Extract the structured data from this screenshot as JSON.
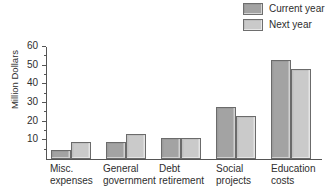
{
  "chart_data": {
    "type": "bar",
    "title": "",
    "xlabel": "",
    "ylabel": "Million Dollars",
    "ylim": [
      0,
      60
    ],
    "ytick_labels": [
      "10",
      "20",
      "30",
      "40",
      "50",
      "60"
    ],
    "ytick_values": [
      10,
      20,
      30,
      40,
      50,
      60
    ],
    "minor_tick_values": [
      5,
      15,
      25,
      35,
      45,
      55
    ],
    "grid": false,
    "legend_position": "top-right",
    "categories": [
      "Misc. expenses",
      "General government",
      "Debt retirement",
      "Social projects",
      "Education costs"
    ],
    "category_lines": [
      [
        "Misc.",
        "expenses"
      ],
      [
        "General",
        "government"
      ],
      [
        "Debt",
        "retirement"
      ],
      [
        "Social",
        "projects"
      ],
      [
        "Education",
        "costs"
      ]
    ],
    "series": [
      {
        "name": "Current year",
        "color": "#a3a3a3",
        "values": [
          5,
          9,
          11,
          28,
          53
        ]
      },
      {
        "name": "Next year",
        "color": "#cacaca",
        "values": [
          9,
          13.5,
          11,
          23,
          48
        ]
      }
    ]
  },
  "legend": {
    "items": [
      {
        "label": "Current year",
        "color": "#a3a3a3"
      },
      {
        "label": "Next year",
        "color": "#cacaca"
      }
    ]
  },
  "colors": {
    "current_year": "#a3a3a3",
    "next_year": "#cacaca",
    "bar_border": "#6b6b6b",
    "axis": "#555555",
    "text": "#2e2e2e",
    "background": "#ffffff"
  }
}
